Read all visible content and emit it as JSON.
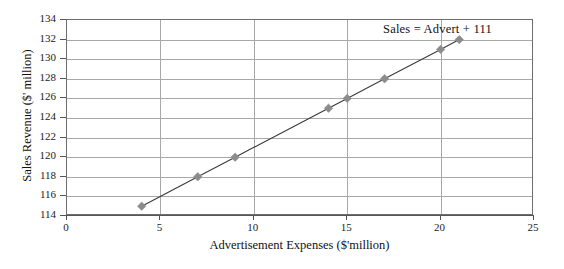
{
  "chart_data": {
    "type": "line",
    "title": "",
    "xlabel": "Advertisement Expenses ($'million)",
    "ylabel": "Sales Revenue ($' million)",
    "xlim": [
      0,
      25
    ],
    "ylim": [
      114,
      134
    ],
    "xticks": [
      0,
      5,
      10,
      15,
      20,
      25
    ],
    "yticks": [
      114,
      116,
      118,
      120,
      122,
      124,
      126,
      128,
      130,
      132,
      134
    ],
    "grid": true,
    "legend": "none",
    "annotation": "Sales = Advert + 111",
    "series": [
      {
        "name": "Sales Revenue",
        "marker": "diamond",
        "marker_color": "#8c8c8c",
        "line_color": "#3a3a3a",
        "x": [
          4,
          7,
          9,
          14,
          15,
          17,
          20,
          21
        ],
        "values": [
          115,
          118,
          120,
          125,
          126,
          128,
          131,
          132
        ]
      }
    ]
  },
  "axis": {
    "x_tick_labels": [
      "0",
      "5",
      "10",
      "15",
      "20",
      "25"
    ],
    "y_tick_labels": [
      "114",
      "116",
      "118",
      "120",
      "122",
      "124",
      "126",
      "128",
      "130",
      "132",
      "134"
    ]
  },
  "colors": {
    "marker": "#8c8c8c",
    "line": "#3a3a3a",
    "gridline": "#a8a8a8",
    "frame": "#6e6e6e",
    "text": "#111111"
  }
}
